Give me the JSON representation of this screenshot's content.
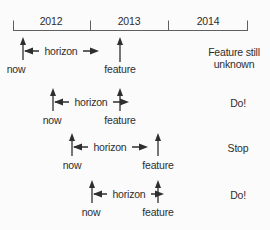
{
  "colors": {
    "background": "#fbfbfb",
    "ink": "#2e2e2e",
    "axis": "#5f5f5f"
  },
  "timeline": {
    "years": [
      "2012",
      "2013",
      "2014"
    ]
  },
  "rows": [
    {
      "now_label": "now",
      "horizon_label": "horizon",
      "feature_label": "feature",
      "status_line1": "Feature still",
      "status_line2": "unknown"
    },
    {
      "now_label": "now",
      "horizon_label": "horizon",
      "feature_label": "feature",
      "status_line1": "Do!",
      "status_line2": ""
    },
    {
      "now_label": "now",
      "horizon_label": "horizon",
      "feature_label": "feature",
      "status_line1": "Stop",
      "status_line2": ""
    },
    {
      "now_label": "now",
      "horizon_label": "horizon",
      "feature_label": "feature",
      "status_line1": "Do!",
      "status_line2": ""
    }
  ]
}
